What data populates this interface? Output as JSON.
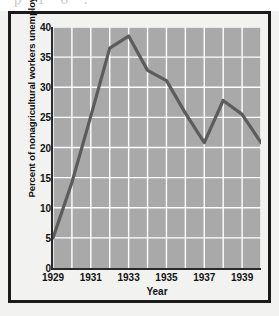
{
  "page": {
    "ghost_text_above": "p  1  6      ."
  },
  "figure": {
    "y_axis_title": "Percent of nonagricultural workers unemployed",
    "x_axis_title": "Year",
    "plot_bg_color": "#a9a9a9",
    "gridline_color": "#ffffff",
    "line_color": "#5c5c5c",
    "frame_color": "#1b1b1b"
  },
  "chart_data": {
    "type": "line",
    "title": "",
    "xlabel": "Year",
    "ylabel": "Percent of nonagricultural workers unemployed",
    "x": [
      1929,
      1930,
      1931,
      1932,
      1933,
      1934,
      1935,
      1936,
      1937,
      1938,
      1939,
      1940
    ],
    "values": [
      5.0,
      14.2,
      25.2,
      36.5,
      38.5,
      32.8,
      31.1,
      25.7,
      20.8,
      27.8,
      25.5,
      20.8
    ],
    "series": [
      {
        "name": "Percent of nonagricultural workers unemployed",
        "values": [
          5.0,
          14.2,
          25.2,
          36.5,
          38.5,
          32.8,
          31.1,
          25.7,
          20.8,
          27.8,
          25.5,
          20.8
        ]
      }
    ],
    "xlim": [
      1929,
      1940
    ],
    "ylim": [
      0,
      40
    ],
    "ytick_labels": [
      "0",
      "5",
      "10",
      "15",
      "20",
      "25",
      "30",
      "35",
      "40"
    ],
    "ytick_values": [
      0,
      5,
      10,
      15,
      20,
      25,
      30,
      35,
      40
    ],
    "xtick_labels": [
      "1929",
      "1931",
      "1933",
      "1935",
      "1937",
      "1939"
    ],
    "xtick_values": [
      1929,
      1931,
      1933,
      1935,
      1937,
      1939
    ],
    "grid": true,
    "grid_axes": "both",
    "legend": false,
    "legend_position": "none",
    "annotations": []
  }
}
